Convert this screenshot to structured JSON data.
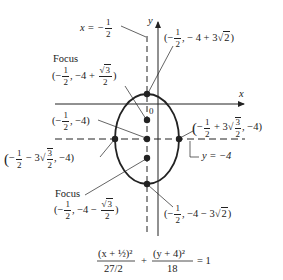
{
  "diagram": {
    "title_equation": {
      "term1_num": "(x + ½)²",
      "term1_den": "27/2",
      "plus": "+",
      "term2_num": "(y + 4)²",
      "term2_den": "18",
      "equals": "= 1"
    },
    "axes": {
      "x_label": "x",
      "y_label": "y",
      "origin_label": "0"
    },
    "lines": {
      "vertical_line_label": "x = −",
      "vertical_line_frac_num": "1",
      "vertical_line_frac_den": "2",
      "horizontal_line_label": "y = −4"
    },
    "points": {
      "top_vertex": {
        "prefix": "(−",
        "frac_num": "1",
        "frac_den": "2",
        "rest": ", − 4 + 3",
        "sqrt": "2",
        "close": ")"
      },
      "focus_top_title": "Focus",
      "focus_top": {
        "prefix": "(−",
        "frac_num": "1",
        "frac_den": "2",
        "rest": ", −4 + ",
        "sqrt_num": "3",
        "sqrt_den": "2",
        "close": ")"
      },
      "center": {
        "prefix": "(−",
        "frac_num": "1",
        "frac_den": "2",
        "rest": ", −4)"
      },
      "right_vertex": {
        "prefix": "(−",
        "frac_num": "1",
        "frac_den": "2",
        "rest": " + 3",
        "sqrt_num": "3",
        "sqrt_den": "2",
        "close": ", −4)"
      },
      "left_vertex": {
        "prefix": "(−",
        "frac_num": "1",
        "frac_den": "2",
        "rest": " − 3",
        "sqrt_num": "3",
        "sqrt_den": "2",
        "close": ", −4)"
      },
      "focus_bottom_title": "Focus",
      "focus_bottom": {
        "prefix": "(−",
        "frac_num": "1",
        "frac_den": "2",
        "rest": ", −4 − ",
        "sqrt_num": "3",
        "sqrt_den": "2",
        "close": ")"
      },
      "bottom_vertex": {
        "prefix": "(−",
        "frac_num": "1",
        "frac_den": "2",
        "rest": ", −4 − 3",
        "sqrt": "2",
        "close": ")"
      }
    },
    "colors": {
      "ink": "#222222",
      "background": "#ffffff"
    }
  }
}
